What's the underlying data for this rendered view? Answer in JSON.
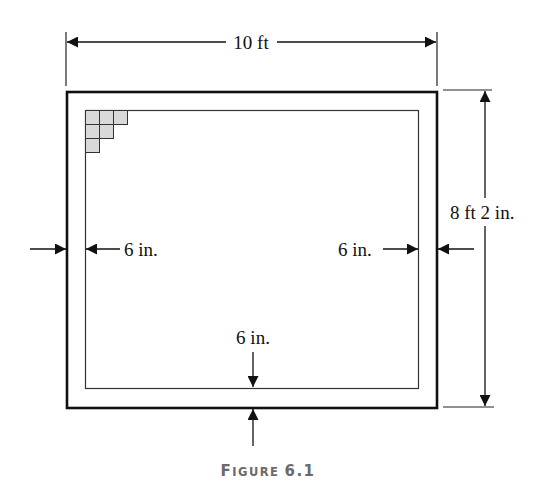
{
  "figure": {
    "caption_first": "F",
    "caption_rest": "IGURE",
    "caption_number": "6.1",
    "colors": {
      "line": "#111111",
      "tile_fill": "#d9d9d9",
      "tile_stroke": "#333333",
      "caption": "#6a6a6a"
    }
  },
  "dimensions": {
    "width_label": "10 ft",
    "height_label": "8 ft 2 in.",
    "left_border_label": "6 in.",
    "right_border_label": "6 in.",
    "bottom_border_label": "6 in."
  },
  "tiles": {
    "rows": [
      3,
      2,
      1
    ]
  }
}
